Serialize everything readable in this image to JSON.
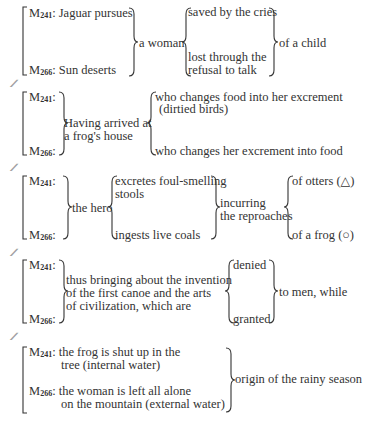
{
  "separator": "//",
  "blocks": [
    {
      "m1": {
        "label": "M",
        "sub": "241",
        "text": ": Jaguar pursues"
      },
      "m2": {
        "label": "M",
        "sub": "266",
        "text": ": Sun deserts"
      },
      "middle": "a woman",
      "options": [
        "saved by the cries",
        "lost through the",
        "refusal to talk"
      ],
      "result": "of a child"
    },
    {
      "m1": {
        "label": "M",
        "sub": "241",
        "text": ":"
      },
      "m2": {
        "label": "M",
        "sub": "266",
        "text": ":"
      },
      "middle": [
        "Having arrived at",
        "a frog's house"
      ],
      "options": [
        "who changes food into her excrement",
        "(dirtied birds)",
        "who changes her excrement into food"
      ]
    },
    {
      "m1": {
        "label": "M",
        "sub": "241",
        "text": ":"
      },
      "m2": {
        "label": "M",
        "sub": "266",
        "text": ":"
      },
      "middle": "the hero",
      "options": [
        "excretes foul-smelling",
        "stools",
        "ingests live coals"
      ],
      "connector": [
        "incurring",
        "the reproaches"
      ],
      "results": [
        "of otters (△)",
        "of a frog (○)"
      ]
    },
    {
      "m1": {
        "label": "M",
        "sub": "241",
        "text": ":"
      },
      "m2": {
        "label": "M",
        "sub": "266",
        "text": ":"
      },
      "middle": [
        "thus bringing about the invention",
        "of the first canoe and the arts",
        "of civilization, which are"
      ],
      "options": [
        "denied",
        "granted"
      ],
      "result": "to men, while"
    },
    {
      "m1": {
        "label": "M",
        "sub": "241",
        "text": ": the frog is shut up in the",
        "text2": "tree (internal water)"
      },
      "m2": {
        "label": "M",
        "sub": "266",
        "text": ": the woman is left all alone",
        "text2": "on the mountain (external water)"
      },
      "result": "origin of the rainy season"
    }
  ]
}
